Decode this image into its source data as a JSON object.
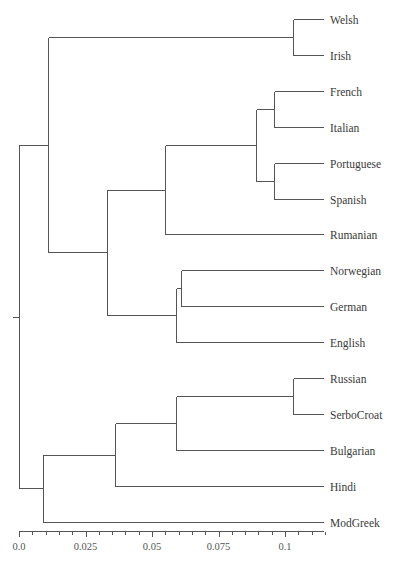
{
  "chart_data": {
    "type": "dendrogram",
    "orientation": "horizontal (leaves right, root left)",
    "title": "",
    "xlabel": "",
    "x_axis": {
      "range": [
        0.0,
        0.115
      ],
      "ticks": [
        0.0,
        0.025,
        0.05,
        0.075,
        0.1
      ],
      "tick_labels": [
        "0.0",
        "0.025",
        "0.05",
        "0.075",
        "0.1"
      ],
      "minor_tick_step": 0.005
    },
    "leaves": [
      "Welsh",
      "Irish",
      "French",
      "Italian",
      "Portuguese",
      "Spanish",
      "Rumanian",
      "Norwegian",
      "German",
      "English",
      "Russian",
      "SerboCroat",
      "Bulgarian",
      "Hindi",
      "ModGreek"
    ],
    "merges": [
      {
        "id": "c1",
        "children": [
          "Welsh",
          "Irish"
        ],
        "height": 0.103
      },
      {
        "id": "c2",
        "children": [
          "French",
          "Italian"
        ],
        "height": 0.096
      },
      {
        "id": "c3",
        "children": [
          "Portuguese",
          "Spanish"
        ],
        "height": 0.096
      },
      {
        "id": "c4",
        "children": [
          "c2",
          "c3"
        ],
        "height": 0.089
      },
      {
        "id": "c5",
        "children": [
          "c4",
          "Rumanian"
        ],
        "height": 0.055
      },
      {
        "id": "c6",
        "children": [
          "Norwegian",
          "German"
        ],
        "height": 0.061
      },
      {
        "id": "c7",
        "children": [
          "c6",
          "English"
        ],
        "height": 0.059
      },
      {
        "id": "c8",
        "children": [
          "c5",
          "c7"
        ],
        "height": 0.033
      },
      {
        "id": "c9",
        "children": [
          "c1",
          "c8"
        ],
        "height": 0.011
      },
      {
        "id": "c10",
        "children": [
          "Russian",
          "SerboCroat"
        ],
        "height": 0.103
      },
      {
        "id": "c11",
        "children": [
          "c10",
          "Bulgarian"
        ],
        "height": 0.059
      },
      {
        "id": "c12",
        "children": [
          "c11",
          "Hindi"
        ],
        "height": 0.036
      },
      {
        "id": "c13",
        "children": [
          "c12",
          "ModGreek"
        ],
        "height": 0.009
      },
      {
        "id": "root",
        "children": [
          "c9",
          "c13"
        ],
        "height": 0.0
      }
    ],
    "grid": false,
    "legend": null
  },
  "labels": {
    "leaves": [
      "Welsh",
      "Irish",
      "French",
      "Italian",
      "Portuguese",
      "Spanish",
      "Rumanian",
      "Norwegian",
      "German",
      "English",
      "Russian",
      "SerboCroat",
      "Bulgarian",
      "Hindi",
      "ModGreek"
    ],
    "ticks": [
      "0.0",
      "0.025",
      "0.05",
      "0.075",
      "0.1"
    ]
  },
  "colors": {
    "line": "#555555",
    "text": "#3a3a3a",
    "background": "#ffffff"
  }
}
